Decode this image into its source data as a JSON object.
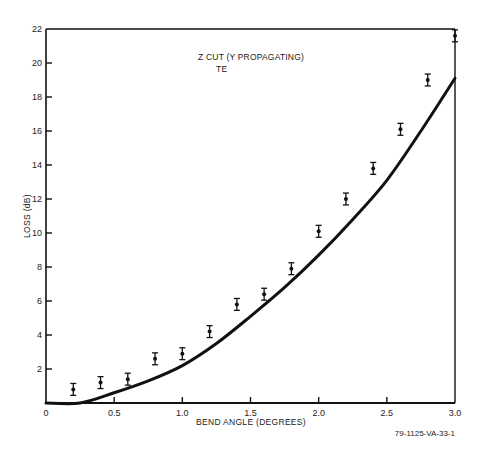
{
  "chart_data": {
    "type": "scatter",
    "title": "",
    "annotation": [
      "Z CUT (Y PROPAGATING)",
      "TE"
    ],
    "xlabel": "BEND ANGLE (DEGREES)",
    "ylabel": "LOSS (dB)",
    "figure_id": "79-1125-VA-33-1",
    "xlim": [
      0,
      3.0
    ],
    "ylim": [
      0,
      22
    ],
    "x_ticks": [
      0,
      0.5,
      1.0,
      1.5,
      2.0,
      2.5,
      3.0
    ],
    "x_tick_labels": [
      "0",
      "0.5",
      "1.0",
      "1.5",
      "2.0",
      "2.5",
      "3.0"
    ],
    "y_ticks": [
      2,
      4,
      6,
      8,
      10,
      12,
      14,
      16,
      18,
      20,
      22
    ],
    "y_tick_labels": [
      "2",
      "4",
      "6",
      "8",
      "10",
      "12",
      "14",
      "16",
      "18",
      "20",
      "22"
    ],
    "grid": false,
    "legend": null,
    "series": [
      {
        "name": "Measured",
        "style": "points-with-error-bars",
        "x": [
          0.2,
          0.4,
          0.6,
          0.8,
          1.0,
          1.2,
          1.4,
          1.6,
          1.8,
          2.0,
          2.2,
          2.4,
          2.6,
          2.8,
          3.0
        ],
        "values": [
          0.8,
          1.2,
          1.4,
          2.6,
          2.9,
          4.2,
          5.8,
          6.4,
          7.9,
          10.1,
          12.0,
          13.8,
          16.1,
          19.0,
          21.6
        ],
        "error": 0.35
      },
      {
        "name": "Theory",
        "style": "solid-line",
        "x": [
          0,
          0.25,
          0.5,
          0.75,
          1.0,
          1.25,
          1.5,
          1.75,
          2.0,
          2.25,
          2.5,
          2.75,
          3.0
        ],
        "values": [
          0,
          0.0,
          0.6,
          1.3,
          2.2,
          3.5,
          5.1,
          6.8,
          8.7,
          10.8,
          13.1,
          16.0,
          19.1
        ]
      }
    ]
  }
}
